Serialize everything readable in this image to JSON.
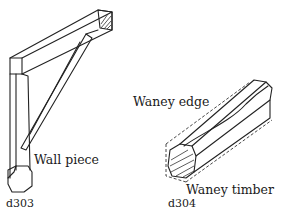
{
  "figures": [
    {
      "id": "d303",
      "labels": [
        "Wall piece"
      ]
    },
    {
      "id": "d304",
      "labels": [
        "Waney edge",
        "Waney timber"
      ]
    }
  ]
}
